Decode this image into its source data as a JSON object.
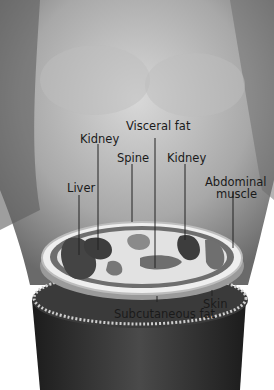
{
  "labels": {
    "visceral_fat": "Visceral fat",
    "kidney_left": "Kidney",
    "spine": "Spine",
    "kidney_right": "Kidney",
    "liver": "Liver",
    "abdominal_muscle_1": "Abdominal",
    "abdominal_muscle_2": "muscle",
    "skin": "Skin",
    "subcutaneous_fat": "Subcutaneous fat"
  },
  "colors": {
    "background": "#ffffff",
    "skin_light": "#cfcfcf",
    "skin_dark": "#7a7a7a",
    "organ": "#4a4a4a",
    "fat": "#e4e4e4",
    "pants": "#2a2a2a"
  }
}
